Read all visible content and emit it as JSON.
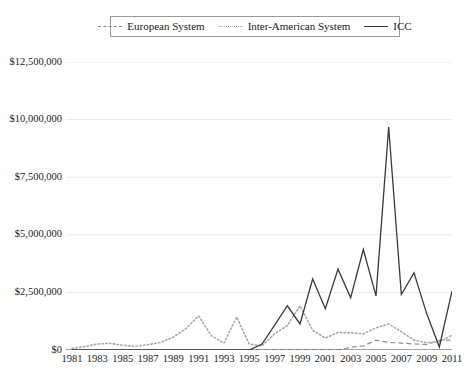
{
  "chart_data": {
    "type": "line",
    "title": "",
    "xlabel": "",
    "ylabel": "",
    "grid": true,
    "legend_position": "top-center",
    "ylim": [
      0,
      12500000
    ],
    "ytick_labels": [
      "$0",
      "$2,500,000",
      "$5,000,000",
      "$7,500,000",
      "$10,000,000",
      "$12,500,000"
    ],
    "ytick_values": [
      0,
      2500000,
      5000000,
      7500000,
      10000000,
      12500000
    ],
    "x": [
      1981,
      1982,
      1983,
      1984,
      1985,
      1986,
      1987,
      1988,
      1989,
      1990,
      1991,
      1992,
      1993,
      1994,
      1995,
      1996,
      1997,
      1998,
      1999,
      2000,
      2001,
      2002,
      2003,
      2004,
      2005,
      2006,
      2007,
      2008,
      2009,
      2010,
      2011
    ],
    "xtick_labels": [
      "1981",
      "1983",
      "1985",
      "1987",
      "1989",
      "1991",
      "1993",
      "1995",
      "1997",
      "1999",
      "2001",
      "2003",
      "2005",
      "2007",
      "2009",
      "2011"
    ],
    "xtick_values": [
      1981,
      1983,
      1985,
      1987,
      1989,
      1991,
      1993,
      1995,
      1997,
      1999,
      2001,
      2003,
      2005,
      2007,
      2009,
      2011
    ],
    "series": [
      {
        "name": "European System",
        "style": "dashed",
        "color": "#8e8e8e",
        "values": [
          0,
          0,
          0,
          0,
          0,
          0,
          0,
          0,
          0,
          0,
          0,
          0,
          0,
          0,
          0,
          0,
          0,
          0,
          0,
          0,
          0,
          0,
          120000,
          180000,
          420000,
          330000,
          300000,
          260000,
          240000,
          420000,
          430000
        ]
      },
      {
        "name": "Inter-American System",
        "style": "dotted",
        "color": "#a8a8a8",
        "values": [
          60000,
          150000,
          260000,
          290000,
          200000,
          160000,
          230000,
          330000,
          560000,
          930000,
          1480000,
          620000,
          300000,
          1430000,
          250000,
          180000,
          700000,
          1060000,
          1920000,
          860000,
          520000,
          760000,
          740000,
          700000,
          960000,
          1130000,
          790000,
          430000,
          320000,
          350000,
          640000
        ]
      },
      {
        "name": "ICC",
        "style": "solid",
        "color": "#3a3a3a",
        "values": [
          0,
          0,
          0,
          0,
          0,
          0,
          0,
          0,
          0,
          0,
          0,
          0,
          0,
          0,
          0,
          260000,
          1080000,
          1920000,
          1130000,
          3080000,
          1790000,
          3510000,
          2270000,
          4360000,
          2350000,
          9680000,
          2410000,
          3350000,
          1580000,
          130000,
          2560000
        ]
      }
    ]
  },
  "legend": {
    "entries": [
      {
        "label": "European System",
        "icon": "dashed-line-icon"
      },
      {
        "label": "Inter-American System",
        "icon": "dotted-line-icon"
      },
      {
        "label": "ICC",
        "icon": "solid-line-icon"
      }
    ]
  }
}
